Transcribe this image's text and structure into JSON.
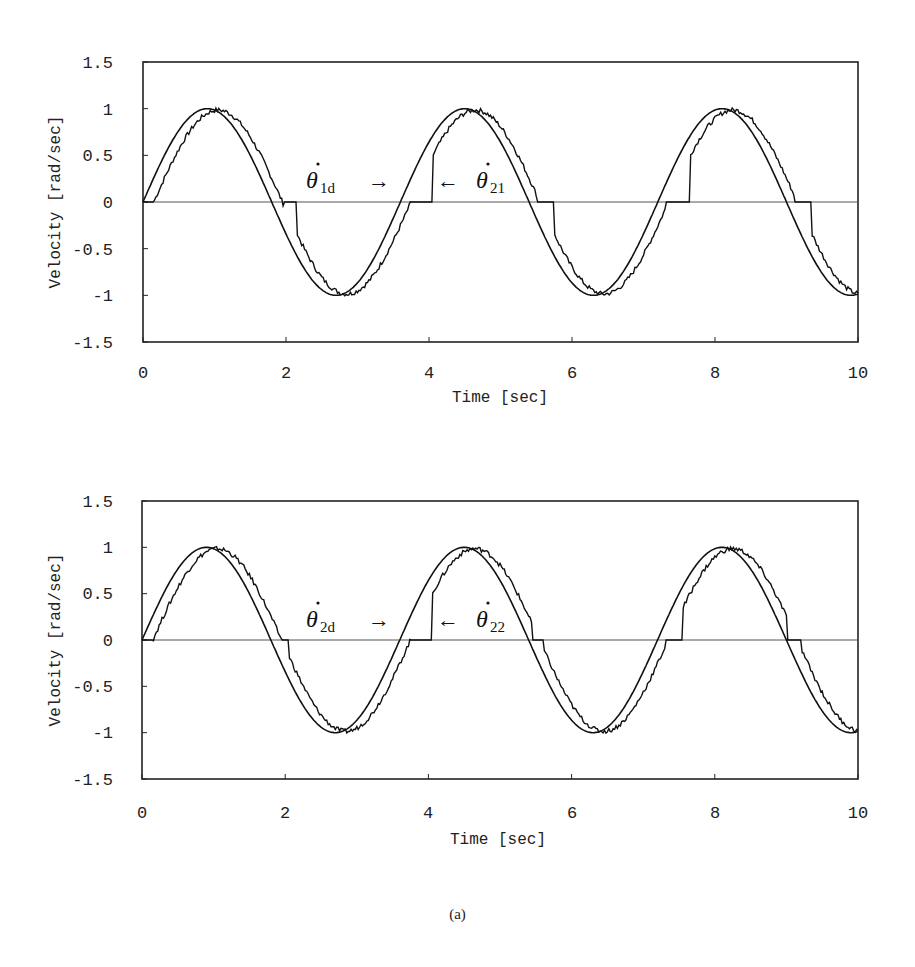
{
  "caption": "(a)",
  "chart_data": [
    {
      "type": "line",
      "title": "",
      "xlabel": "Time [sec]",
      "ylabel": "Velocity [rad/sec]",
      "xlim": [
        0,
        10
      ],
      "ylim": [
        -1.5,
        1.5
      ],
      "xticks": [
        "0",
        "2",
        "4",
        "6",
        "8",
        "10"
      ],
      "yticks": [
        "1.5",
        "1",
        "0.5",
        "0",
        "-0.5",
        "-1",
        "-1.5"
      ],
      "grid": false,
      "zero_line": true,
      "annotations": [
        {
          "symbol": "θ̇",
          "subscript": "1d",
          "arrow": "→",
          "x": 3.6,
          "y": 0.3
        },
        {
          "symbol": "θ̇",
          "subscript": "21",
          "arrow": "←",
          "x": 4.1,
          "y": 0.3
        }
      ],
      "series": [
        {
          "name": "θ̇1d (desired)",
          "description": "sine wave, amplitude 1, period ≈3.6 s",
          "amplitude": 1.0,
          "period": 3.6,
          "x": [
            0,
            0.9,
            1.8,
            2.7,
            3.6,
            4.5,
            5.4,
            6.3,
            7.2,
            8.1,
            9.0,
            9.9,
            10
          ],
          "values": [
            0,
            1,
            0,
            -1,
            0,
            1,
            0,
            -1,
            0,
            1,
            0,
            -1,
            -0.98
          ]
        },
        {
          "name": "θ̇21 (actual)",
          "description": "lagged sine with dead-zone plateaus at 0",
          "x": [
            0,
            0.15,
            1.0,
            1.98,
            2.15,
            2.8,
            3.75,
            4.05,
            4.65,
            5.5,
            5.75,
            6.4,
            7.3,
            7.65,
            8.2,
            9.1,
            9.35,
            10
          ],
          "values": [
            0,
            0,
            1,
            0,
            0,
            -0.97,
            0,
            0,
            0.98,
            0,
            0,
            -0.97,
            0,
            0,
            0.98,
            0,
            0,
            -0.93
          ]
        }
      ]
    },
    {
      "type": "line",
      "title": "",
      "xlabel": "Time [sec]",
      "ylabel": "Velocity [rad/sec]",
      "xlim": [
        0,
        10
      ],
      "ylim": [
        -1.5,
        1.5
      ],
      "xticks": [
        "0",
        "2",
        "4",
        "6",
        "8",
        "10"
      ],
      "yticks": [
        "1.5",
        "1",
        "0.5",
        "0",
        "-0.5",
        "-1",
        "-1.5"
      ],
      "grid": false,
      "zero_line": true,
      "annotations": [
        {
          "symbol": "θ̇",
          "subscript": "2d",
          "arrow": "→",
          "x": 3.6,
          "y": 0.3
        },
        {
          "symbol": "θ̇",
          "subscript": "22",
          "arrow": "←",
          "x": 4.1,
          "y": 0.3
        }
      ],
      "series": [
        {
          "name": "θ̇2d (desired)",
          "description": "sine wave, amplitude 1, period ≈3.6 s",
          "amplitude": 1.0,
          "period": 3.6,
          "x": [
            0,
            0.9,
            1.8,
            2.7,
            3.6,
            4.5,
            5.4,
            6.3,
            7.2,
            8.1,
            9.0,
            9.9,
            10
          ],
          "values": [
            0,
            1,
            0,
            -1,
            0,
            1,
            0,
            -1,
            0,
            1,
            0,
            -1,
            -0.98
          ]
        },
        {
          "name": "θ̇22 (actual)",
          "description": "lagged sine with dead-zone plateaus at 0",
          "x": [
            0,
            0.15,
            1.0,
            1.95,
            2.05,
            2.8,
            3.75,
            4.05,
            4.65,
            5.45,
            5.6,
            6.4,
            7.3,
            7.55,
            8.2,
            9.0,
            9.2,
            10
          ],
          "values": [
            0,
            0,
            0.97,
            0,
            0,
            -0.97,
            0,
            0,
            0.98,
            0,
            0,
            -0.97,
            0,
            0,
            0.98,
            0,
            0,
            -0.93
          ]
        }
      ]
    }
  ],
  "charts": [
    {
      "ylabel": "Velocity [rad/sec]",
      "xlabel": "Time [sec]",
      "yticks": [
        "1.5",
        "1",
        "0.5",
        "0",
        "-0.5",
        "-1",
        "-1.5"
      ],
      "xticks": [
        "0",
        "2",
        "4",
        "6",
        "8",
        "10"
      ],
      "label_left": {
        "symbol": "θ",
        "sub": "1d",
        "arrow": "→"
      },
      "label_right": {
        "symbol": "θ",
        "sub": "21",
        "arrow": "←"
      }
    },
    {
      "ylabel": "Velocity [rad/sec]",
      "xlabel": "Time [sec]",
      "yticks": [
        "1.5",
        "1",
        "0.5",
        "0",
        "-0.5",
        "-1",
        "-1.5"
      ],
      "xticks": [
        "0",
        "2",
        "4",
        "6",
        "8",
        "10"
      ],
      "label_left": {
        "symbol": "θ",
        "sub": "2d",
        "arrow": "→"
      },
      "label_right": {
        "symbol": "θ",
        "sub": "22",
        "arrow": "←"
      }
    }
  ]
}
